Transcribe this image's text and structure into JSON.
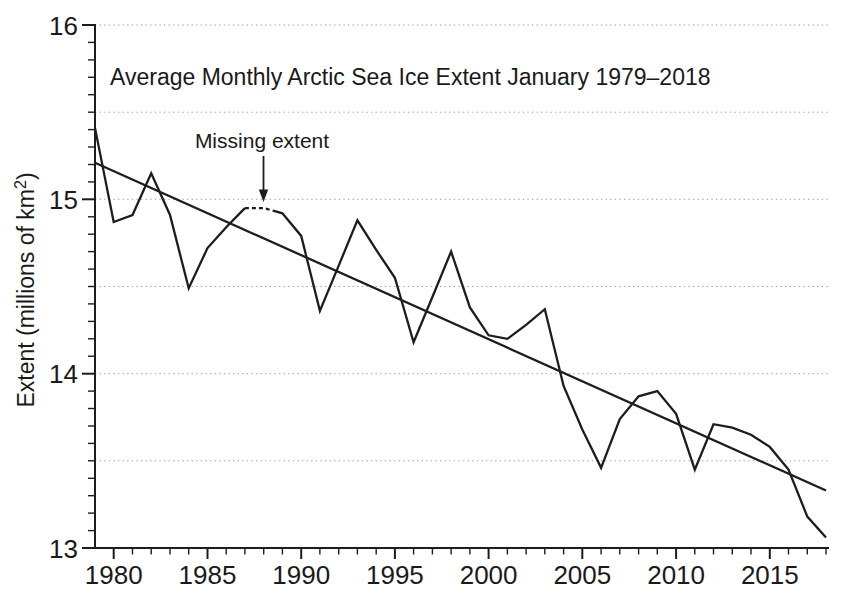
{
  "chart_data": {
    "type": "line",
    "title": "Average Monthly Arctic Sea Ice Extent January 1979–2018",
    "xlabel": "",
    "ylabel": "Extent (millions of km²)",
    "ylabel_parts": {
      "base": "Extent (millions of km",
      "sup": "2",
      "close": ")"
    },
    "xlim": [
      1979,
      2018
    ],
    "ylim": [
      13,
      16
    ],
    "x_major_ticks": [
      1980,
      1985,
      1990,
      1995,
      2000,
      2005,
      2010,
      2015
    ],
    "x_minor_step": 1,
    "y_major_ticks": [
      13,
      14,
      15,
      16
    ],
    "y_minor_step": 0.1,
    "gridlines_at": [
      13.5,
      14,
      14.5,
      15,
      15.5,
      16
    ],
    "grid_style": "dotted",
    "legend": "none",
    "x": [
      1979,
      1980,
      1981,
      1982,
      1983,
      1984,
      1985,
      1986,
      1987,
      1988,
      1989,
      1990,
      1991,
      1992,
      1993,
      1994,
      1995,
      1996,
      1997,
      1998,
      1999,
      2000,
      2001,
      2002,
      2003,
      2004,
      2005,
      2006,
      2007,
      2008,
      2009,
      2010,
      2011,
      2012,
      2013,
      2014,
      2015,
      2016,
      2017,
      2018
    ],
    "series": [
      {
        "name": "January average monthly sea ice extent",
        "values": [
          15.41,
          14.87,
          14.91,
          15.15,
          14.91,
          14.49,
          14.72,
          14.84,
          14.95,
          14.95,
          14.92,
          14.79,
          14.36,
          14.62,
          14.88,
          14.71,
          14.55,
          14.18,
          14.44,
          14.7,
          14.38,
          14.22,
          14.2,
          14.28,
          14.37,
          13.93,
          13.68,
          13.46,
          13.74,
          13.87,
          13.9,
          13.77,
          13.45,
          13.71,
          13.69,
          13.65,
          13.58,
          13.45,
          13.18,
          13.06
        ]
      }
    ],
    "trend": {
      "name": "Linear trend line",
      "x": [
        1979,
        2018
      ],
      "values": [
        15.21,
        13.33
      ]
    },
    "missing_segment": {
      "from_year": 1987,
      "to_year": 1988.5,
      "value": 14.95,
      "label": "Missing extent"
    },
    "colors": {
      "line": "#1d1d1d",
      "trend": "#1d1d1d",
      "axis": "#1d1d1d",
      "grid": "#9a9a9a",
      "text": "#1a1a1a",
      "background": "#ffffff"
    }
  }
}
